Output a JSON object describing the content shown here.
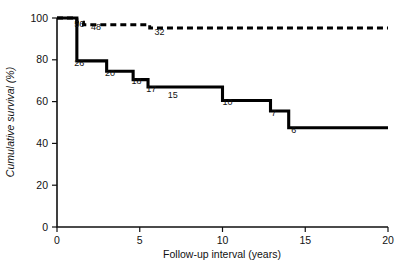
{
  "chart_data": {
    "type": "line",
    "title": "",
    "subtitle": "",
    "xlabel": "Follow-up interval (years)",
    "ylabel": "Cumulative survival (%)",
    "xlim": [
      0,
      20
    ],
    "ylim": [
      0,
      100
    ],
    "xticks": [
      0,
      5,
      10,
      15,
      20
    ],
    "yticks": [
      0,
      20,
      40,
      60,
      80,
      100
    ],
    "xtick_labels": [
      "0",
      "5",
      "10",
      "15",
      "20"
    ],
    "ytick_labels": [
      "0",
      "20",
      "40",
      "60",
      "80",
      "100"
    ],
    "grid": false,
    "legend": "none",
    "legend_position": "none",
    "series": [
      {
        "name": "upper-curve-dashed",
        "style": "dashed",
        "x": [
          0.0,
          1.2,
          1.2,
          1.6,
          1.6,
          5.6,
          5.6,
          20.0
        ],
        "y": [
          100,
          100,
          98,
          98,
          96.8,
          96.8,
          95.2,
          95.2
        ],
        "steps": [
          {
            "x": 0.0,
            "survival": 100
          },
          {
            "x": 1.2,
            "survival": 98
          },
          {
            "x": 1.6,
            "survival": 96.8
          },
          {
            "x": 5.6,
            "survival": 95.2
          },
          {
            "x": 20.0,
            "survival": 95.2
          }
        ],
        "at_risk_labels": [
          {
            "text": "56",
            "x": 1.35,
            "y": 95.5
          },
          {
            "text": "48",
            "x": 2.35,
            "y": 94.3
          },
          {
            "text": "32",
            "x": 6.2,
            "y": 92.0
          }
        ]
      },
      {
        "name": "lower-curve-solid",
        "style": "solid",
        "x": [
          0.0,
          1.2,
          1.2,
          3.0,
          3.0,
          4.6,
          4.6,
          5.5,
          5.5,
          10.0,
          10.0,
          12.9,
          12.9,
          14.0,
          14.0,
          20.0
        ],
        "y": [
          100,
          100,
          79.5,
          79.5,
          74.5,
          74.5,
          70.5,
          70.5,
          67.0,
          67.0,
          60.5,
          60.5,
          55.5,
          55.5,
          47.5,
          47.5
        ],
        "steps": [
          {
            "x": 0.0,
            "survival": 100
          },
          {
            "x": 1.2,
            "survival": 79.5
          },
          {
            "x": 3.0,
            "survival": 74.5
          },
          {
            "x": 4.6,
            "survival": 70.5
          },
          {
            "x": 5.5,
            "survival": 67.0
          },
          {
            "x": 10.0,
            "survival": 60.5
          },
          {
            "x": 12.9,
            "survival": 55.5
          },
          {
            "x": 14.0,
            "survival": 47.5
          },
          {
            "x": 20.0,
            "survival": 47.5
          }
        ],
        "at_risk_labels": [
          {
            "text": "26",
            "x": 1.35,
            "y": 77.0
          },
          {
            "text": "20",
            "x": 3.2,
            "y": 72.2
          },
          {
            "text": "18",
            "x": 4.8,
            "y": 68.2
          },
          {
            "text": "17",
            "x": 5.7,
            "y": 64.6
          },
          {
            "text": "15",
            "x": 7.0,
            "y": 61.8
          },
          {
            "text": "10",
            "x": 10.3,
            "y": 58.2
          },
          {
            "text": "7",
            "x": 13.1,
            "y": 53.0
          },
          {
            "text": "6",
            "x": 14.3,
            "y": 45.0
          }
        ]
      }
    ]
  }
}
